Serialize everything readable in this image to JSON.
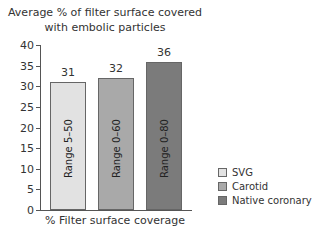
{
  "chart_data": {
    "type": "bar",
    "title_lines": [
      "Average % of filter surface covered",
      "with embolic particles"
    ],
    "xlabel": "% Filter surface coverage",
    "ylabel": "",
    "ylim": [
      0,
      40
    ],
    "yticks": [
      0,
      5,
      10,
      15,
      20,
      25,
      30,
      35,
      40
    ],
    "categories": [
      "SVG",
      "Carotid",
      "Native coronary"
    ],
    "values": [
      31,
      32,
      36
    ],
    "ranges": [
      "Range 5–50",
      "Range 0–60",
      "Range 0–80"
    ],
    "colors": [
      "#e2e2e2",
      "#a9a9a9",
      "#7b7b7b"
    ],
    "legend": [
      "SVG",
      "Carotid",
      "Native coronary"
    ],
    "legend_position": "right",
    "grid": false
  }
}
